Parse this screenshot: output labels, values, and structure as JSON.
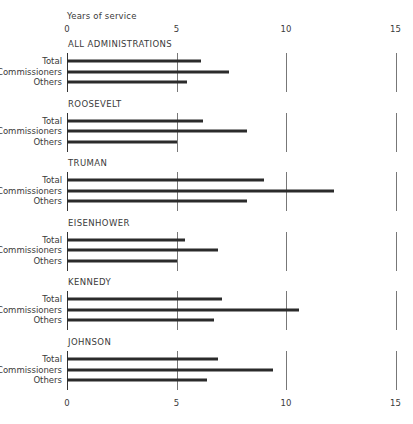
{
  "chart_data": {
    "type": "bar",
    "orientation": "horizontal",
    "title": "",
    "xlabel": "Years of service",
    "ylabel": "",
    "xlim": [
      0,
      15
    ],
    "xticks": [
      "0",
      "5",
      "10",
      "15"
    ],
    "grid": true,
    "legend": null,
    "row_labels": [
      "Total",
      "Commissioners",
      "Others"
    ],
    "groups": [
      {
        "name": "ALL ADMINISTRATIONS",
        "values": {
          "Total": 6.1,
          "Commissioners": 7.4,
          "Others": 5.5
        }
      },
      {
        "name": "ROOSEVELT",
        "values": {
          "Total": 6.2,
          "Commissioners": 8.2,
          "Others": 5.0
        }
      },
      {
        "name": "TRUMAN",
        "values": {
          "Total": 9.0,
          "Commissioners": 12.2,
          "Others": 8.2
        }
      },
      {
        "name": "EISENHOWER",
        "values": {
          "Total": 5.4,
          "Commissioners": 6.9,
          "Others": 5.0
        }
      },
      {
        "name": "KENNEDY",
        "values": {
          "Total": 7.1,
          "Commissioners": 10.6,
          "Others": 6.7
        }
      },
      {
        "name": "JOHNSON",
        "values": {
          "Total": 6.9,
          "Commissioners": 9.4,
          "Others": 6.4
        }
      }
    ]
  },
  "axis": {
    "title": "Years of service",
    "top_ticks": [
      "0",
      "5",
      "10",
      "15"
    ],
    "bottom_ticks": [
      "0",
      "5",
      "10",
      "15"
    ]
  }
}
